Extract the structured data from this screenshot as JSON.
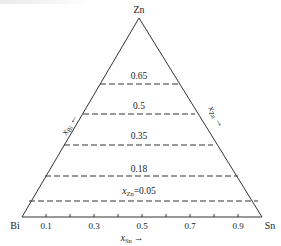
{
  "diagram": {
    "type": "ternary-composition-diagram",
    "vertices": {
      "top": "Zn",
      "bottom_left": "Bi",
      "bottom_right": "Sn"
    },
    "axes": {
      "bottom": {
        "label": "x",
        "subscript": "Sn",
        "arrow": "→"
      },
      "left": {
        "label": "x",
        "subscript": "Bi",
        "arrow": "←"
      },
      "right": {
        "label": "x",
        "subscript": "Zn",
        "arrow": "←"
      }
    },
    "bottom_ticks": [
      "0.1",
      "0.3",
      "0.5",
      "0.7",
      "0.9"
    ],
    "iso_lines": [
      {
        "value": 0.65,
        "label": "0.65"
      },
      {
        "value": 0.5,
        "label": "0.5"
      },
      {
        "value": 0.35,
        "label": "0.35"
      },
      {
        "value": 0.18,
        "label": "0.18"
      },
      {
        "value": 0.05,
        "label_prefix": "x",
        "label_sub": "Zn",
        "label_suffix": "=0.05"
      }
    ],
    "colors": {
      "line": "#333333",
      "text": "#222222",
      "background": "#ffffff"
    }
  }
}
